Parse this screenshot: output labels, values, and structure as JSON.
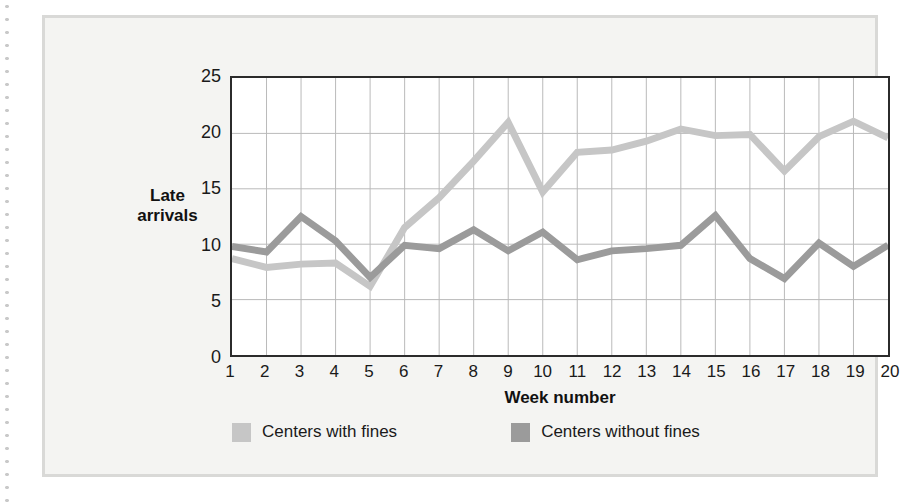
{
  "chart_data": {
    "type": "line",
    "title": "",
    "xlabel": "Week number",
    "ylabel": "Late arrivals",
    "ylabel_lines": [
      "Late",
      "arrivals"
    ],
    "categories": [
      1,
      2,
      3,
      4,
      5,
      6,
      7,
      8,
      9,
      10,
      11,
      12,
      13,
      14,
      15,
      16,
      17,
      18,
      19,
      20
    ],
    "x": [
      1,
      2,
      3,
      4,
      5,
      6,
      7,
      8,
      9,
      10,
      11,
      12,
      13,
      14,
      15,
      16,
      17,
      18,
      19,
      20
    ],
    "xtick_labels": [
      "1",
      "2",
      "3",
      "4",
      "5",
      "6",
      "7",
      "8",
      "9",
      "10",
      "11",
      "12",
      "13",
      "14",
      "15",
      "16",
      "17",
      "18",
      "19",
      "20"
    ],
    "ytick_labels": [
      "0",
      "5",
      "10",
      "15",
      "20",
      "25"
    ],
    "yticks": [
      0,
      5,
      10,
      15,
      20,
      25
    ],
    "ylim": [
      0,
      25
    ],
    "xlim": [
      1,
      20
    ],
    "grid": true,
    "grid_color": "#b9b9b9",
    "legend_position": "bottom",
    "series": [
      {
        "name": "Centers with fines",
        "color": "#c6c6c6",
        "values": [
          8.7,
          7.9,
          8.2,
          8.3,
          6.2,
          11.5,
          14.2,
          17.5,
          21.0,
          14.7,
          18.3,
          18.5,
          19.3,
          20.4,
          19.8,
          19.9,
          16.6,
          19.7,
          21.1,
          19.6
        ]
      },
      {
        "name": "Centers without fines",
        "color": "#9b9b9b",
        "values": [
          9.8,
          9.3,
          12.5,
          10.3,
          7.0,
          9.9,
          9.6,
          11.3,
          9.4,
          11.1,
          8.6,
          9.4,
          9.6,
          9.9,
          12.6,
          8.7,
          6.9,
          10.1,
          8.0,
          9.9
        ]
      }
    ]
  },
  "legend": {
    "items": [
      {
        "label": "Centers with fines",
        "color": "#c6c6c6"
      },
      {
        "label": "Centers without fines",
        "color": "#9b9b9b"
      }
    ]
  },
  "colors": {
    "panel_background": "#f4f4f2",
    "panel_border": "#d9d9d7",
    "plot_background": "#ffffff",
    "axis": "#2b2b2b",
    "grid": "#b9b9b9",
    "series_light": "#c6c6c6",
    "series_dark": "#9b9b9b",
    "text": "#1a1a1a"
  }
}
